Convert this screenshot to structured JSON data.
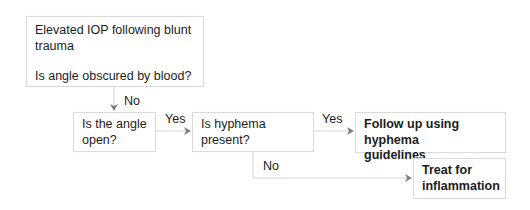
{
  "diagram": {
    "type": "flowchart",
    "colors": {
      "box_border": "#dadada",
      "connector": "#d4d4d4",
      "arrowhead": "#7f7f7f",
      "text": "#1c1c1c"
    },
    "nodes": {
      "start": {
        "line1": "Elevated IOP following blunt",
        "line2": "trauma",
        "question": "Is angle obscured by blood?"
      },
      "angle_open": {
        "line1": "Is the angle",
        "line2": "open?"
      },
      "hyphema_present": {
        "line1": "Is hyphema",
        "line2": "present?"
      },
      "follow_up": {
        "line1": "Follow up using hyphema",
        "line2": "guidelines"
      },
      "treat": {
        "line1": "Treat for",
        "line2": "inflammation"
      }
    },
    "edges": [
      {
        "from": "start",
        "to": "angle_open",
        "label": "No"
      },
      {
        "from": "angle_open",
        "to": "hyphema_present",
        "label": "Yes"
      },
      {
        "from": "hyphema_present",
        "to": "follow_up",
        "label": "Yes"
      },
      {
        "from": "hyphema_present",
        "to": "treat",
        "label": "No"
      }
    ]
  }
}
